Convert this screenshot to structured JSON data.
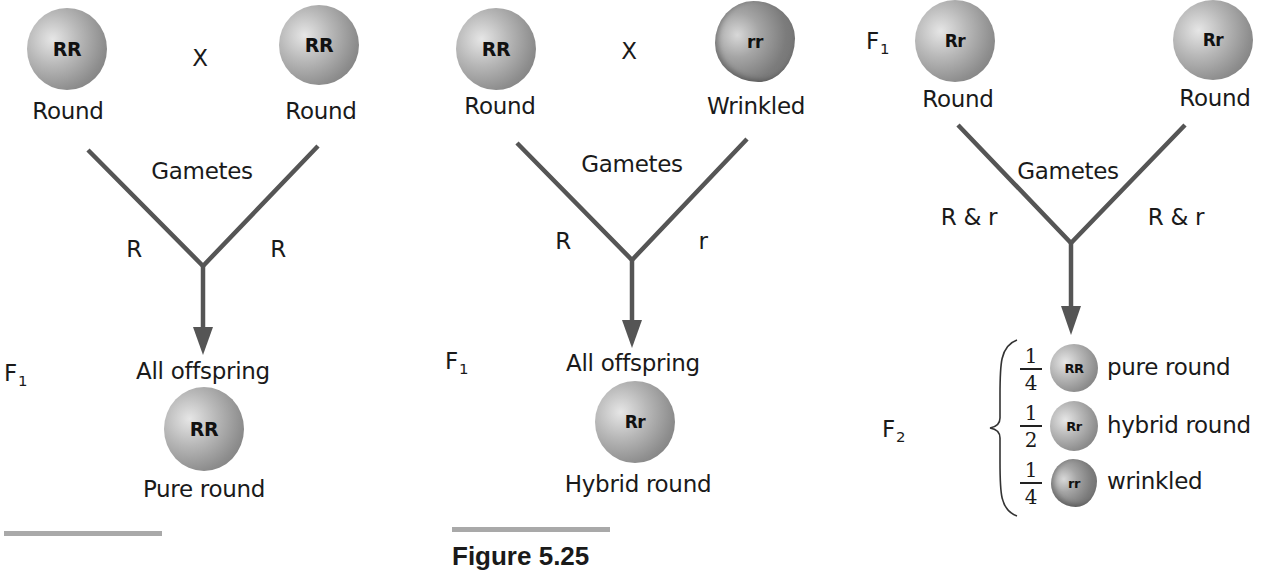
{
  "colors": {
    "line": "#555555",
    "text": "#1a1a1a",
    "caption_bar": "#a9a9a9"
  },
  "panels": [
    {
      "id": "cross-pure",
      "cross_symbol": "X",
      "parents": [
        {
          "genotype": "RR",
          "phenotype": "Round",
          "shape": "round"
        },
        {
          "genotype": "RR",
          "phenotype": "Round",
          "shape": "round"
        }
      ],
      "gametes_label": "Gametes",
      "gamete_left": "R",
      "gamete_right": "R",
      "generation_label": "F",
      "generation_sub": "1",
      "offspring_label": "All offspring",
      "offspring": {
        "genotype": "RR",
        "phenotype": "Pure round"
      }
    },
    {
      "id": "cross-hybrid",
      "cross_symbol": "X",
      "parents": [
        {
          "genotype": "RR",
          "phenotype": "Round",
          "shape": "round"
        },
        {
          "genotype": "rr",
          "phenotype": "Wrinkled",
          "shape": "wrinkled"
        }
      ],
      "gametes_label": "Gametes",
      "gamete_left": "R",
      "gamete_right": "r",
      "generation_label": "F",
      "generation_sub": "1",
      "offspring_label": "All offspring",
      "offspring": {
        "genotype": "Rr",
        "phenotype": "Hybrid round"
      }
    },
    {
      "id": "cross-f1",
      "parent_generation_label": "F",
      "parent_generation_sub": "1",
      "parents": [
        {
          "genotype": "Rr",
          "phenotype": "Round",
          "shape": "round"
        },
        {
          "genotype": "Rr",
          "phenotype": "Round",
          "shape": "round"
        }
      ],
      "gametes_label": "Gametes",
      "gamete_left": "R & r",
      "gamete_right": "R & r",
      "generation_label": "F",
      "generation_sub": "2",
      "results": [
        {
          "num": "1",
          "den": "4",
          "genotype": "RR",
          "phenotype": "pure round",
          "shape": "round"
        },
        {
          "num": "1",
          "den": "2",
          "genotype": "Rr",
          "phenotype": "hybrid round",
          "shape": "round"
        },
        {
          "num": "1",
          "den": "4",
          "genotype": "rr",
          "phenotype": "wrinkled",
          "shape": "wrinkled"
        }
      ]
    }
  ],
  "captions": {
    "center": "Figure 5.25"
  }
}
